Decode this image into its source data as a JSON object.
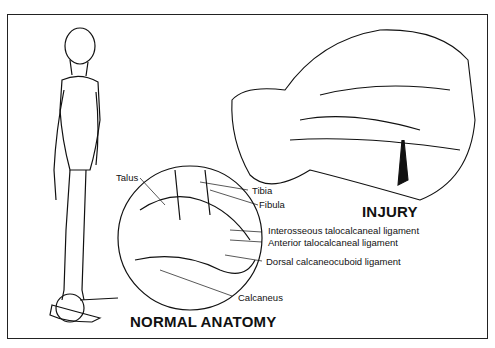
{
  "figure": {
    "labels": {
      "talus": "Talus",
      "tibia": "Tibia",
      "fibula": "Fibula",
      "interosseous": "Interosseous talocalcaneal  ligament",
      "anterior": "Anterior talocalcaneal ligament",
      "dorsal": "Dorsal calcaneocuboid ligament",
      "calcaneus": "Calcaneus"
    },
    "titles": {
      "injury": "INJURY",
      "normal": "NORMAL ANATOMY"
    }
  }
}
